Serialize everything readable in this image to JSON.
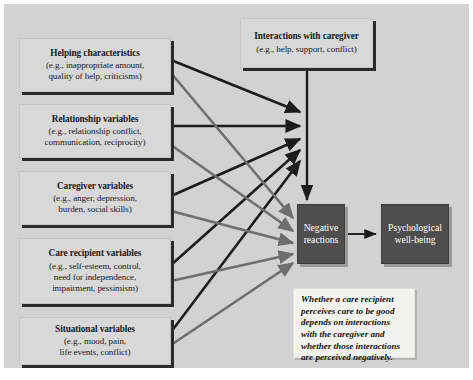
{
  "figure": {
    "background_color": "#d2d2d2",
    "page_color": "#ffffff",
    "antecedent_box_color": "#d8d8d8",
    "outcome_box_color": "#4e4e4e",
    "note_box_color": "#f2f2ee",
    "arrow_dark_color": "#1c1c1c",
    "arrow_light_color": "#6e6e6e"
  },
  "antecedents": [
    {
      "id": "helping-characteristics",
      "title": "Helping characteristics",
      "examples": [
        "(e.g., inappropriate amount,",
        "quality of help, criticisms)"
      ]
    },
    {
      "id": "relationship-variables",
      "title": "Relationship variables",
      "examples": [
        "(e.g., relationship conflict,",
        "communication, reciprocity)"
      ]
    },
    {
      "id": "caregiver-variables",
      "title": "Caregiver variables",
      "examples": [
        "(e.g., anger, depression,",
        "burden, social skills)"
      ]
    },
    {
      "id": "care-recipient-variables",
      "title": "Care recipient variables",
      "examples": [
        "(e.g., self-esteem, control,",
        "need for independence,",
        "impairment, pessimism)"
      ]
    },
    {
      "id": "situational-variables",
      "title": "Situational variables",
      "examples": [
        "(e.g., mood, pain,",
        "life events, conflict)"
      ]
    }
  ],
  "interactions": {
    "id": "interactions-with-caregiver",
    "title": "Interactions with caregiver",
    "examples": [
      "(e.g., help, support, conflict)"
    ]
  },
  "outcomes": [
    {
      "id": "negative-reactions",
      "lines": [
        "Negative",
        "reactions"
      ]
    },
    {
      "id": "psychological-well-being",
      "lines": [
        "Psychological",
        "well-being"
      ]
    }
  ],
  "note": {
    "id": "interpretation-note",
    "lines": [
      "Whether a care recipient",
      "perceives care to be good",
      "depends on interactions",
      "with the caregiver and",
      "whether those interactions",
      "are perceived negatively."
    ]
  }
}
